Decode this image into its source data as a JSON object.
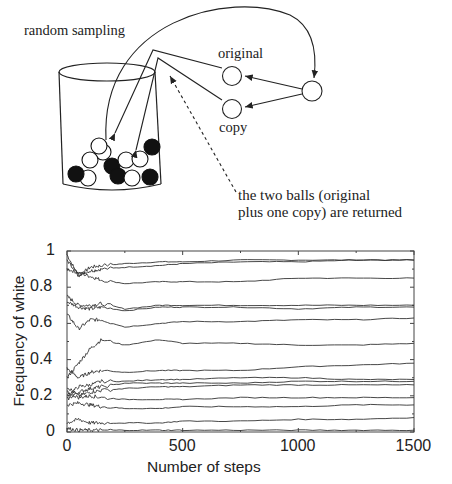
{
  "diagram": {
    "labels": {
      "random_sampling": "random sampling",
      "original": "original",
      "copy": "copy",
      "returned_line1": "the two balls (original",
      "returned_line2": "plus one copy) are returned"
    },
    "urn_balls": [
      {
        "x": 88,
        "y": 178,
        "color": "white"
      },
      {
        "x": 103,
        "y": 152,
        "color": "white"
      },
      {
        "x": 90,
        "y": 160,
        "color": "white"
      },
      {
        "x": 76,
        "y": 174,
        "color": "black"
      },
      {
        "x": 112,
        "y": 166,
        "color": "black"
      },
      {
        "x": 118,
        "y": 176,
        "color": "black"
      },
      {
        "x": 126,
        "y": 160,
        "color": "white"
      },
      {
        "x": 140,
        "y": 159,
        "color": "white"
      },
      {
        "x": 132,
        "y": 178,
        "color": "white"
      },
      {
        "x": 152,
        "y": 147,
        "color": "black"
      },
      {
        "x": 150,
        "y": 177,
        "color": "black"
      },
      {
        "x": 99,
        "y": 146,
        "color": "white"
      }
    ]
  },
  "chart_data": {
    "type": "line",
    "title": "",
    "xlabel": "Number of steps",
    "ylabel": "Frequency of white",
    "xlim": [
      0,
      1500
    ],
    "ylim": [
      0,
      1
    ],
    "x_ticks": [
      "0",
      "500",
      "1000",
      "1500"
    ],
    "y_ticks": [
      "0",
      "0.2",
      "0.4",
      "0.6",
      "0.8",
      "1"
    ],
    "grid": false,
    "legend": null,
    "note": "Polya urn simulation: multiple independent runs, each converging to a different limiting frequency",
    "x": [
      0,
      50,
      100,
      150,
      250,
      400,
      500,
      750,
      1000,
      1250,
      1500
    ],
    "series": [
      {
        "name": "run1",
        "values": [
          0.98,
          0.86,
          0.91,
          0.92,
          0.93,
          0.94,
          0.94,
          0.95,
          0.95,
          0.95,
          0.95
        ]
      },
      {
        "name": "run2",
        "values": [
          0.95,
          0.87,
          0.89,
          0.9,
          0.91,
          0.92,
          0.93,
          0.94,
          0.94,
          0.95,
          0.95
        ]
      },
      {
        "name": "run3",
        "values": [
          0.9,
          0.88,
          0.86,
          0.84,
          0.82,
          0.83,
          0.83,
          0.83,
          0.85,
          0.85,
          0.85
        ]
      },
      {
        "name": "run4",
        "values": [
          0.75,
          0.7,
          0.7,
          0.71,
          0.68,
          0.7,
          0.7,
          0.7,
          0.7,
          0.7,
          0.7
        ]
      },
      {
        "name": "run5",
        "values": [
          0.72,
          0.69,
          0.68,
          0.69,
          0.67,
          0.69,
          0.69,
          0.69,
          0.68,
          0.69,
          0.69
        ]
      },
      {
        "name": "run6",
        "values": [
          0.65,
          0.57,
          0.62,
          0.62,
          0.58,
          0.6,
          0.61,
          0.61,
          0.62,
          0.62,
          0.63
        ]
      },
      {
        "name": "run7",
        "values": [
          0.3,
          0.38,
          0.46,
          0.51,
          0.48,
          0.51,
          0.49,
          0.49,
          0.48,
          0.48,
          0.49
        ]
      },
      {
        "name": "run8",
        "values": [
          0.35,
          0.3,
          0.33,
          0.34,
          0.33,
          0.34,
          0.34,
          0.34,
          0.36,
          0.37,
          0.38
        ]
      },
      {
        "name": "run9",
        "values": [
          0.2,
          0.25,
          0.26,
          0.28,
          0.28,
          0.29,
          0.29,
          0.3,
          0.3,
          0.29,
          0.29
        ]
      },
      {
        "name": "run10",
        "values": [
          0.18,
          0.22,
          0.24,
          0.25,
          0.27,
          0.27,
          0.27,
          0.27,
          0.28,
          0.28,
          0.28
        ]
      },
      {
        "name": "run11",
        "values": [
          0.25,
          0.2,
          0.22,
          0.23,
          0.24,
          0.25,
          0.25,
          0.26,
          0.26,
          0.26,
          0.26
        ]
      },
      {
        "name": "run12",
        "values": [
          0.22,
          0.19,
          0.2,
          0.19,
          0.18,
          0.18,
          0.18,
          0.19,
          0.19,
          0.19,
          0.19
        ]
      },
      {
        "name": "run13",
        "values": [
          0.15,
          0.16,
          0.15,
          0.14,
          0.13,
          0.13,
          0.14,
          0.14,
          0.14,
          0.15,
          0.15
        ]
      },
      {
        "name": "run14",
        "values": [
          0.05,
          0.07,
          0.05,
          0.05,
          0.05,
          0.05,
          0.06,
          0.06,
          0.07,
          0.07,
          0.08
        ]
      },
      {
        "name": "run15",
        "values": [
          0.02,
          0.01,
          0.01,
          0.01,
          0.01,
          0.01,
          0.01,
          0.01,
          0.01,
          0.01,
          0.01
        ]
      }
    ]
  }
}
